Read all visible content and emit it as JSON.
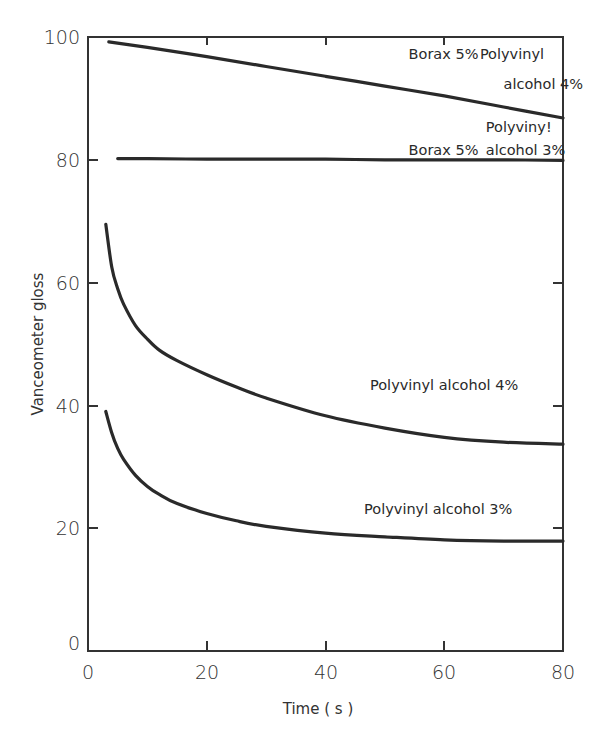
{
  "chart_data": {
    "type": "line",
    "title": "",
    "xlabel": "Time ( s )",
    "ylabel": "Vanceometer gloss",
    "xlim": [
      0,
      80
    ],
    "ylim": [
      0,
      100
    ],
    "xticks": [
      0,
      20,
      40,
      60,
      80
    ],
    "yticks": [
      0,
      20,
      40,
      60,
      80,
      100
    ],
    "grid": false,
    "legend": "none (curves labelled inline)",
    "series": [
      {
        "name": "Borax 5% Polyvinyl alcohol 4%",
        "x": [
          3.5,
          10,
          20,
          30,
          40,
          50,
          60,
          70,
          80
        ],
        "y": [
          99.2,
          98.3,
          96.8,
          95.2,
          93.6,
          92.0,
          90.4,
          88.6,
          86.8
        ]
      },
      {
        "name": "Borax 5% Polyvinyl alcohol 3%",
        "x": [
          5,
          10,
          20,
          30,
          40,
          50,
          60,
          70,
          80
        ],
        "y": [
          80.2,
          80.2,
          80.1,
          80.1,
          80.1,
          80.0,
          80.0,
          80.0,
          79.9
        ]
      },
      {
        "name": "Polyvinyl alcohol 4%",
        "x": [
          3,
          4,
          5,
          6,
          8,
          10,
          12,
          15,
          20,
          25,
          30,
          40,
          50,
          60,
          70,
          80
        ],
        "y": [
          69.5,
          62.5,
          59.0,
          56.5,
          53.0,
          50.8,
          49.0,
          47.3,
          45.0,
          43.0,
          41.2,
          38.3,
          36.3,
          34.8,
          34.0,
          33.7
        ]
      },
      {
        "name": "Polyvinyl alcohol 3%",
        "x": [
          3,
          4,
          5,
          6,
          8,
          10,
          12,
          15,
          20,
          25,
          30,
          40,
          50,
          60,
          70,
          80
        ],
        "y": [
          39.0,
          35.5,
          33.0,
          31.2,
          28.6,
          26.8,
          25.5,
          24.0,
          22.4,
          21.2,
          20.3,
          19.2,
          18.6,
          18.1,
          17.9,
          17.9
        ]
      }
    ],
    "annotations": [
      {
        "text": "Borax 5%",
        "x": 54,
        "y": 96.5
      },
      {
        "text": "Polyvinyl",
        "x": 66,
        "y": 96.5
      },
      {
        "text": "alcohol 4%",
        "x": 70,
        "y": 91.5
      },
      {
        "text": "Polyviny!",
        "x": 67,
        "y": 84.5
      },
      {
        "text": "Borax 5%",
        "x": 54,
        "y": 80.8
      },
      {
        "text": "alcohol 3%",
        "x": 67,
        "y": 80.8
      },
      {
        "text": "Polyvinyl alcohol 4%",
        "x": 47.5,
        "y": 42.5
      },
      {
        "text": "Polyvinyl alcohol 3%",
        "x": 46.5,
        "y": 22.3
      }
    ]
  },
  "labels": {
    "xlabel": "Time ( s )",
    "ylabel": "Vanceometer gloss",
    "xticks": [
      "0",
      "20",
      "40",
      "60",
      "80"
    ],
    "yticks": [
      "0",
      "20",
      "40",
      "60",
      "80",
      "100"
    ]
  }
}
